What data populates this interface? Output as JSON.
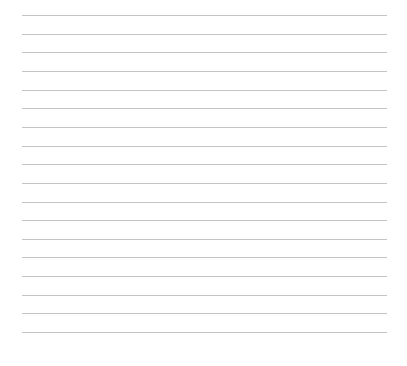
{
  "page": {
    "type": "lined-paper",
    "background_color": "#ffffff",
    "rule_color": "#c4c4c4",
    "rule_count": 18,
    "rule_left_px": 22,
    "rule_right_px": 387,
    "first_rule_top_px": 15,
    "rule_spacing_px": 18.65,
    "text": ""
  }
}
